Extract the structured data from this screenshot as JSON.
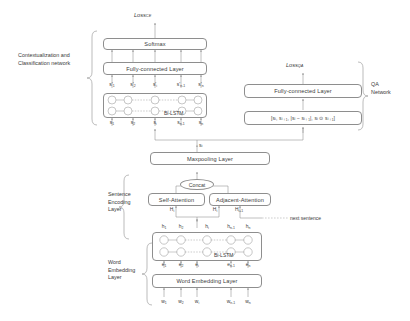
{
  "figure": {
    "losses": {
      "ce": "Loss",
      "ce_sub": "CE",
      "qa": "Loss",
      "qa_sub": "QA"
    },
    "side_labels": {
      "context_class": "Contextualization and\nClassification network",
      "qa_network": "QA\nNetwork",
      "sentence_encoding": "Sentence\nEncoding\nLayer",
      "word_embedding": "Word\nEmbedding\nLayer"
    },
    "boxes": {
      "softmax": "Softmax",
      "fc_top": "Fully-connected Layer",
      "fc_qa": "Fully-connected Layer",
      "qa_features": "[sᵢ, sᵢ₊₁, |sᵢ − sᵢ₊₁|, sᵢ ⊙ sᵢ₊₁]",
      "maxpooling": "Maxpooling Layer",
      "concat": "Concat",
      "self_attention": "Self-Attention",
      "adjacent_attention": "Adjacent-Attention",
      "word_embedding_layer": "Word Embedding Layer"
    },
    "bilstm_tag": "Bi-LSTM",
    "annotations": {
      "next_sentence": "next sentence",
      "sentence_vector": "s",
      "sentence_vector_sub": "i"
    },
    "sentence_bilstm": {
      "outputs": [
        {
          "base": "s'",
          "sub": "1"
        },
        {
          "base": "s'",
          "sub": "2"
        },
        {
          "base": "s'",
          "sub": "i"
        },
        {
          "base": "s'",
          "sub": "n-1"
        },
        {
          "base": "s'",
          "sub": "n"
        }
      ],
      "inputs": [
        {
          "base": "s",
          "sub": "1"
        },
        {
          "base": "s",
          "sub": "2"
        },
        {
          "base": "s",
          "sub": "i"
        },
        {
          "base": "s",
          "sub": "n-1"
        },
        {
          "base": "s",
          "sub": "n"
        }
      ]
    },
    "word_bilstm": {
      "outputs": [
        {
          "base": "h",
          "sub": "1"
        },
        {
          "base": "h",
          "sub": "2"
        },
        {
          "base": "h",
          "sub": "i"
        },
        {
          "base": "h",
          "sub": "n-1"
        },
        {
          "base": "h",
          "sub": "n"
        }
      ],
      "inputs": [
        {
          "base": "e",
          "sub": "1"
        },
        {
          "base": "e",
          "sub": "2"
        },
        {
          "base": "e",
          "sub": "i"
        },
        {
          "base": "e",
          "sub": "n-1"
        },
        {
          "base": "e",
          "sub": "n"
        }
      ],
      "tokens": [
        {
          "base": "w",
          "sub": "1"
        },
        {
          "base": "w",
          "sub": "2"
        },
        {
          "base": "w",
          "sub": "i"
        },
        {
          "base": "w",
          "sub": "n-1"
        },
        {
          "base": "w",
          "sub": "n"
        }
      ]
    },
    "attention_outputs": [
      {
        "base": "H",
        "sub": "i"
      },
      {
        "base": "H",
        "sub": "i"
      },
      {
        "base": "H",
        "sub": "i+1"
      }
    ],
    "colors": {
      "stroke": "#8e8e8e",
      "text": "#3a3a3a",
      "background": "#ffffff"
    }
  }
}
